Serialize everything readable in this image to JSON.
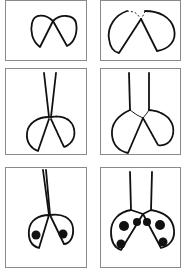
{
  "figure": {
    "layout": {
      "rows": 3,
      "cols": 2
    },
    "colors": {
      "ink": "#111111",
      "border": "#8a8a8a",
      "background": "#ffffff"
    },
    "steps": [
      {
        "index": 1,
        "label": "wings-outline"
      },
      {
        "index": 2,
        "label": "wings-enlarged"
      },
      {
        "index": 3,
        "label": "wings-with-antennae"
      },
      {
        "index": 4,
        "label": "wings-with-antennae-refined"
      },
      {
        "index": 5,
        "label": "ladybug-two-spots"
      },
      {
        "index": 6,
        "label": "ladybug-six-spots"
      }
    ]
  }
}
